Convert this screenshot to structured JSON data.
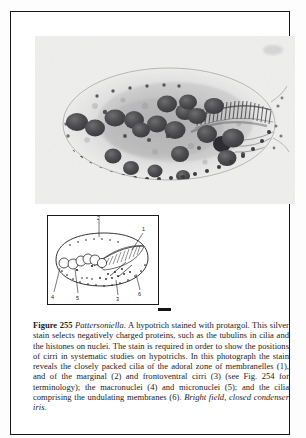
{
  "figure": {
    "number_label": "Figure 255",
    "organism": "Pattersoniella",
    "caption_body": ". A hypotrich stained with protargol. This silver stain selects negatively charged proteins, such as the tubulins in cilia and the histones on nuclei. The stain is required in order to show the positions of cirri in systematic studies on hypotrichs. In this photograph the stain reveals the closely packed cilia of the adoral zone of membranelles (1), and of the marginal (2) and frontoventral cirri (3) (see Fig. 254 for terminology); the macronuclei (4) and micronuclei (5); and the cilia comprising the undulating membranes (6). ",
    "method_note": "Bright field, closed condenser iris.",
    "micrograph_alt": "protargol-stained hypotrich ciliate micrograph",
    "diagram_alt": "line drawing key of ciliate showing numbered structures",
    "diagram_labels": [
      "1",
      "2",
      "3",
      "4",
      "5",
      "6"
    ],
    "colors": {
      "ink": "#1a1a1d",
      "frame": "#16161a",
      "photo_base": "#eeeeee",
      "cell_body": "#9a9a9c",
      "nucleus": "#4a4a4c"
    }
  }
}
